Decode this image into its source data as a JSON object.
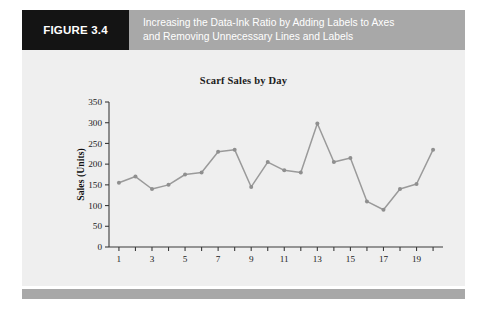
{
  "figure": {
    "tag_label": "FIGURE 3.4",
    "caption_line_1": "Increasing the Data-Ink Ratio by Adding Labels to Axes",
    "caption_line_2": "and Removing Unnecessary Lines and Labels",
    "tag_background": "#141414",
    "header_background": "#a8a8a8",
    "panel_background": "#efefef"
  },
  "chart_data": {
    "type": "line",
    "title": "Scarf Sales by Day",
    "xlabel": "Day",
    "ylabel": "Sales (Units)",
    "x": [
      1,
      2,
      3,
      4,
      5,
      6,
      7,
      8,
      9,
      10,
      11,
      12,
      13,
      14,
      15,
      16,
      17,
      18,
      19,
      20
    ],
    "values": [
      155,
      170,
      140,
      150,
      175,
      180,
      230,
      235,
      145,
      205,
      185,
      180,
      298,
      205,
      215,
      110,
      90,
      140,
      152,
      235
    ],
    "series": [
      {
        "name": "Scarf Sales",
        "values": [
          155,
          170,
          140,
          150,
          175,
          180,
          230,
          235,
          145,
          205,
          185,
          180,
          298,
          205,
          215,
          110,
          90,
          140,
          152,
          235
        ]
      }
    ],
    "ylim": [
      0,
      350
    ],
    "xlim": [
      0.4,
      20.6
    ],
    "ytick_labels": [
      "0",
      "50",
      "100",
      "150",
      "200",
      "250",
      "300",
      "350"
    ],
    "ytick_values": [
      0,
      50,
      100,
      150,
      200,
      250,
      300,
      350
    ],
    "xtick_values": [
      1,
      2,
      3,
      4,
      5,
      6,
      7,
      8,
      9,
      10,
      11,
      12,
      13,
      14,
      15,
      16,
      17,
      18,
      19,
      20
    ],
    "xtick_labels_shown": [
      "1",
      "3",
      "5",
      "7",
      "9",
      "11",
      "13",
      "15",
      "17",
      "19"
    ],
    "xtick_labeled_values": [
      1,
      3,
      5,
      7,
      9,
      11,
      13,
      15,
      17,
      19
    ],
    "grid": false,
    "legend": "none",
    "line_color": "#9a9a9a",
    "marker_color": "#8f8f8f",
    "axis_color": "#3b3b3b"
  }
}
